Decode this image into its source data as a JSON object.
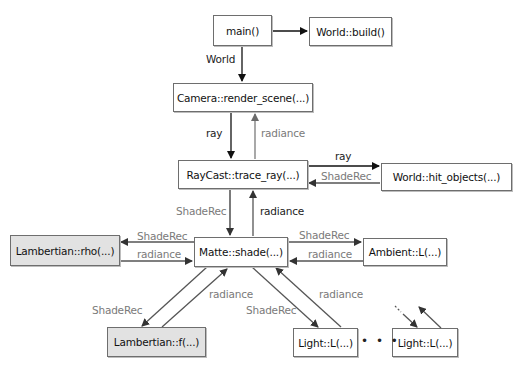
{
  "diagram": {
    "nodes": {
      "main": {
        "label": "main()",
        "style": "white"
      },
      "world_build": {
        "label": "World::build()",
        "style": "white"
      },
      "camera": {
        "label": "Camera::render_scene(...)",
        "style": "white"
      },
      "raycast": {
        "label": "RayCast::trace_ray(...)",
        "style": "white"
      },
      "world_hit": {
        "label": "World::hit_objects(...)",
        "style": "white"
      },
      "matte": {
        "label": "Matte::shade(...)",
        "style": "white"
      },
      "lambert_rho": {
        "label": "Lambertian::rho(...)",
        "style": "gray"
      },
      "ambient": {
        "label": "Ambient::L(...)",
        "style": "white"
      },
      "lambert_f": {
        "label": "Lambertian::f(...)",
        "style": "gray"
      },
      "light1": {
        "label": "Light::L(...)",
        "style": "white"
      },
      "light2": {
        "label": "Light::L(...)",
        "style": "white"
      }
    },
    "edge_labels": {
      "main_to_camera": "World",
      "camera_to_raycast": "ray",
      "raycast_to_camera": "radiance",
      "raycast_to_world": "ray",
      "world_to_raycast": "ShadeRec",
      "raycast_to_matte": "ShadeRec",
      "matte_to_raycast": "radiance",
      "matte_to_rho": "ShadeRec",
      "rho_to_matte": "radiance",
      "matte_to_ambient": "ShadeRec",
      "ambient_to_matte": "radiance",
      "matte_to_f": "ShadeRec",
      "f_to_matte": "radiance",
      "matte_to_light": "ShadeRec",
      "light_to_matte": "radiance"
    },
    "ellipsis": "• • •",
    "colors": {
      "primary_arrow": "#111111",
      "return_arrow": "#7a7a7a",
      "box_border": "#6e6e6e",
      "gray_box_fill": "#e2e2e2"
    }
  }
}
